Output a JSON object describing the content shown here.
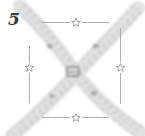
{
  "diagram": {
    "step_number": "5",
    "frame": {
      "shape": "square-outline",
      "stroke_color": "#9a9a9a",
      "markers": [
        {
          "side": "top",
          "icon": "star-icon"
        },
        {
          "side": "left",
          "icon": "star-icon"
        },
        {
          "side": "right",
          "icon": "star-icon"
        },
        {
          "side": "bottom",
          "icon": "star-icon"
        }
      ]
    },
    "strands": [
      {
        "name": "strand-top-left-to-bottom-right",
        "color": "#c8c8c8"
      },
      {
        "name": "strand-top-right-to-bottom-left",
        "color": "#c8c8c8"
      }
    ],
    "center": {
      "icon": "knot-icon",
      "color": "#9c9c9c"
    }
  }
}
